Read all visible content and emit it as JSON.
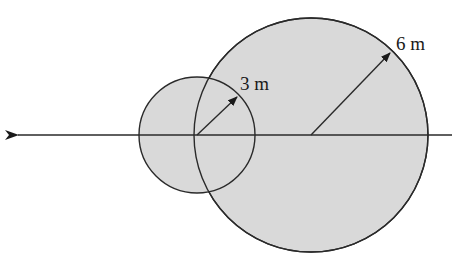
{
  "diagram": {
    "type": "overlapping-circles",
    "fill_color": "#d9d9d9",
    "stroke_color": "#2a2a2a",
    "axis_line": {
      "direction": "arrow-left",
      "y": 135,
      "x_start": 452,
      "x_end": 16
    },
    "small_circle": {
      "cx": 197,
      "cy": 135,
      "r": 58,
      "radius_label": "3 m",
      "radius_arrow_tip": [
        237,
        97
      ]
    },
    "large_circle": {
      "cx": 311,
      "cy": 135,
      "r": 117,
      "radius_label": "6 m",
      "radius_arrow_tip": [
        390,
        53
      ]
    }
  },
  "labels": {
    "small_radius": "3 m",
    "large_radius": "6 m"
  }
}
